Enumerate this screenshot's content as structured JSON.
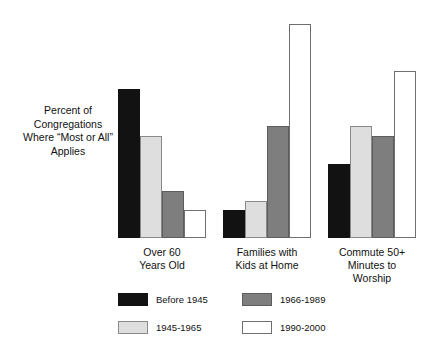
{
  "chart_data": {
    "type": "bar",
    "title": "",
    "subtitle": "",
    "xlabel": "",
    "ylabel": "Percent of\nCongregations\nWhere “Most or All”\nApplies",
    "ylim": [
      0,
      25
    ],
    "grid": false,
    "legend_position": "bottom",
    "value_suffix": "%",
    "categories": [
      "Over 60\nYears Old",
      "Families with\nKids at Home",
      "Commute 50+\nMinutes to\nWorship"
    ],
    "series": [
      {
        "name": "Before 1945",
        "color": "#121212",
        "values": [
          16,
          3,
          8
        ],
        "labels": [
          "16%",
          "3%",
          "8%"
        ]
      },
      {
        "name": "1945-1965",
        "color": "#dedede",
        "values": [
          11,
          4,
          12
        ],
        "labels": [
          "11%",
          "4%",
          "12%"
        ]
      },
      {
        "name": "1966-1989",
        "color": "#7e7e7e",
        "values": [
          5,
          12,
          11
        ],
        "labels": [
          "5%",
          "12%",
          "11%"
        ]
      },
      {
        "name": "1990-2000",
        "color": "#ffffff",
        "values": [
          3,
          23,
          18
        ],
        "labels": [
          "3%",
          "23%",
          "18%"
        ]
      }
    ]
  },
  "legend": {
    "items": [
      {
        "label": "Before 1945",
        "swatch": "black"
      },
      {
        "label": "1966-1989",
        "swatch": "dark-gray"
      },
      {
        "label": "1945-1965",
        "swatch": "light-gray"
      },
      {
        "label": "1990-2000",
        "swatch": "white"
      }
    ]
  },
  "layout": {
    "baseline_y": 238,
    "px_per_percent": 9.3,
    "bar_width": 22,
    "group_lefts": [
      118,
      223,
      328
    ]
  }
}
